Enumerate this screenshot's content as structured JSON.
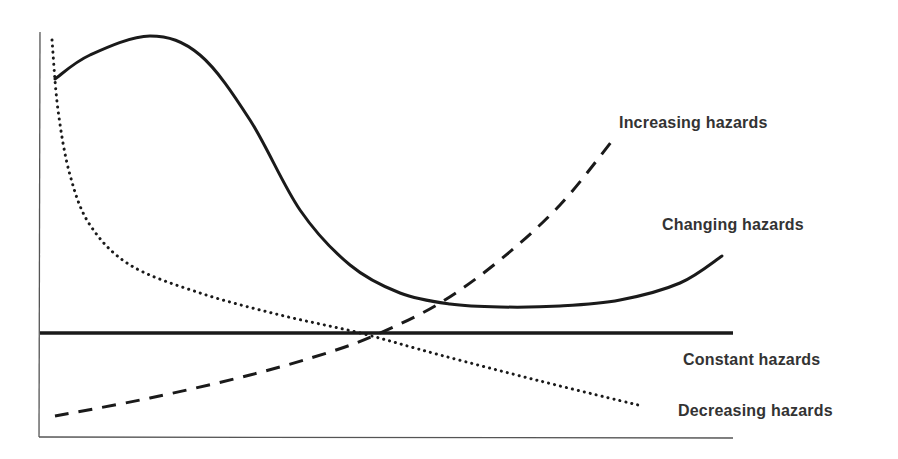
{
  "chart_data": {
    "type": "line",
    "title": "",
    "xlabel": "",
    "ylabel": "",
    "grid": false,
    "legend_position": "inline-right",
    "axes": {
      "origin": [
        40,
        437
      ],
      "y_top": 32,
      "x_right": 733
    },
    "series": [
      {
        "name": "Changing hazards",
        "style": "solid",
        "stroke_width": 3,
        "points": [
          [
            55,
            79
          ],
          [
            90,
            55
          ],
          [
            150,
            36
          ],
          [
            200,
            55
          ],
          [
            250,
            120
          ],
          [
            300,
            210
          ],
          [
            350,
            265
          ],
          [
            400,
            293
          ],
          [
            450,
            304
          ],
          [
            500,
            307
          ],
          [
            560,
            306
          ],
          [
            620,
            300
          ],
          [
            680,
            283
          ],
          [
            722,
            256
          ]
        ]
      },
      {
        "name": "Increasing hazards",
        "style": "dashed",
        "stroke_width": 3,
        "points": [
          [
            55,
            416
          ],
          [
            150,
            398
          ],
          [
            250,
            375
          ],
          [
            330,
            352
          ],
          [
            380,
            333
          ],
          [
            440,
            303
          ],
          [
            500,
            260
          ],
          [
            560,
            205
          ],
          [
            612,
            141
          ]
        ]
      },
      {
        "name": "Constant hazards",
        "style": "solid",
        "stroke_width": 3.5,
        "points": [
          [
            40,
            333
          ],
          [
            733,
            333
          ]
        ]
      },
      {
        "name": "Decreasing hazards",
        "style": "dotted",
        "stroke_width": 3,
        "points": [
          [
            52,
            40
          ],
          [
            58,
            110
          ],
          [
            70,
            175
          ],
          [
            90,
            225
          ],
          [
            130,
            265
          ],
          [
            200,
            293
          ],
          [
            280,
            315
          ],
          [
            360,
            333
          ],
          [
            440,
            355
          ],
          [
            540,
            381
          ],
          [
            638,
            405
          ]
        ]
      }
    ],
    "labels": [
      {
        "text": "Increasing hazards",
        "x": 619,
        "y": 114
      },
      {
        "text": "Changing hazards",
        "x": 662,
        "y": 216
      },
      {
        "text": "Constant hazards",
        "x": 683,
        "y": 351
      },
      {
        "text": "Decreasing hazards",
        "x": 678,
        "y": 402
      }
    ],
    "colors": {
      "line": "#1a1a1a",
      "axis": "#555555",
      "text": "#333333",
      "background": "#ffffff"
    }
  },
  "labels": {
    "increasing": "Increasing hazards",
    "changing": "Changing hazards",
    "constant": "Constant hazards",
    "decreasing": "Decreasing hazards"
  }
}
